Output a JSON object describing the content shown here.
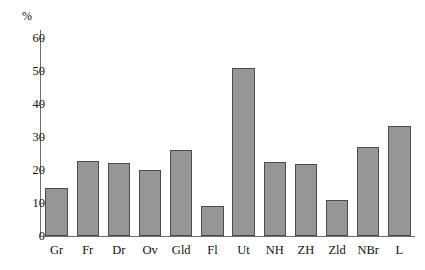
{
  "chart_data": {
    "type": "bar",
    "title": "",
    "xlabel": "",
    "ylabel": "%",
    "ylim": [
      0,
      60
    ],
    "yticks": [
      0,
      10,
      20,
      30,
      40,
      50,
      60
    ],
    "grid": false,
    "legend": "none",
    "bar_color": "#969696",
    "bar_edge_color": "#4b4b4b",
    "axis_color": "#6f6f6f",
    "categories": [
      "Gr",
      "Fr",
      "Dr",
      "Ov",
      "Gld",
      "Fl",
      "Ut",
      "NH",
      "ZH",
      "Zld",
      "NBr",
      "L"
    ],
    "values": [
      14.5,
      22.6,
      22.0,
      19.9,
      26.0,
      9.2,
      50.8,
      22.3,
      21.8,
      10.8,
      27.1,
      33.3
    ]
  }
}
